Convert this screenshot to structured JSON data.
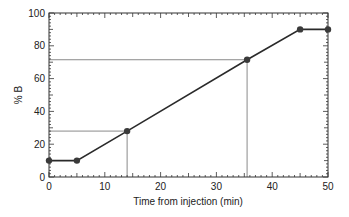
{
  "chart_data": {
    "type": "line",
    "title": "",
    "xlabel": "Time from injection (min)",
    "ylabel": "% B",
    "xlim": [
      0,
      50
    ],
    "ylim": [
      0,
      100
    ],
    "x_ticks": [
      0,
      10,
      20,
      30,
      40,
      50
    ],
    "y_ticks": [
      0,
      20,
      40,
      60,
      80,
      100
    ],
    "grid": false,
    "legend": null,
    "series": [
      {
        "name": "Gradient",
        "x": [
          0,
          5,
          14,
          35.5,
          45,
          50
        ],
        "y": [
          10,
          10,
          28,
          71.5,
          90,
          90
        ]
      }
    ],
    "guide_lines": [
      {
        "x": 14,
        "y": 28
      },
      {
        "x": 35.5,
        "y": 71.5
      }
    ],
    "colors": {
      "line": "#2a2a2a",
      "marker": "#3a3a3a",
      "guide": "#8a8a8a",
      "axis": "#333333"
    }
  }
}
